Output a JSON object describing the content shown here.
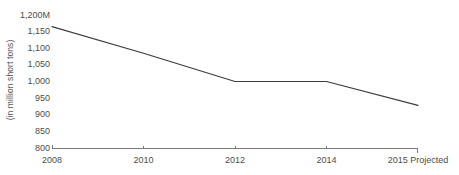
{
  "chart_data": {
    "type": "line",
    "title": "",
    "subtitle": "",
    "xlabel": "",
    "ylabel": "(in million short tons)",
    "categories": [
      "2008",
      "2010",
      "2012",
      "2014",
      "2015 Projected"
    ],
    "x_tick_labels": [
      "2008",
      "2010",
      "2012",
      "2014",
      "2015 Projected"
    ],
    "y_tick_labels": [
      "1,200M",
      "1,150",
      "1,100",
      "1,050",
      "1,000",
      "950",
      "900",
      "850",
      "800"
    ],
    "y_tick_values": [
      1200,
      1150,
      1100,
      1050,
      1000,
      950,
      900,
      850,
      800
    ],
    "ylim": [
      800,
      1200
    ],
    "grid": false,
    "legend": "none",
    "series": [
      {
        "name": "Coal production",
        "values": [
          1165,
          1085,
          1000,
          1000,
          928
        ]
      }
    ],
    "line_color": "#3c3c3c",
    "background_color": "#ffffff",
    "axis_color": "#6e6e6e"
  },
  "axis": {
    "y_title": "(in million short tons)",
    "y_top_label": "1,200M",
    "y_bottom_label": "800"
  }
}
